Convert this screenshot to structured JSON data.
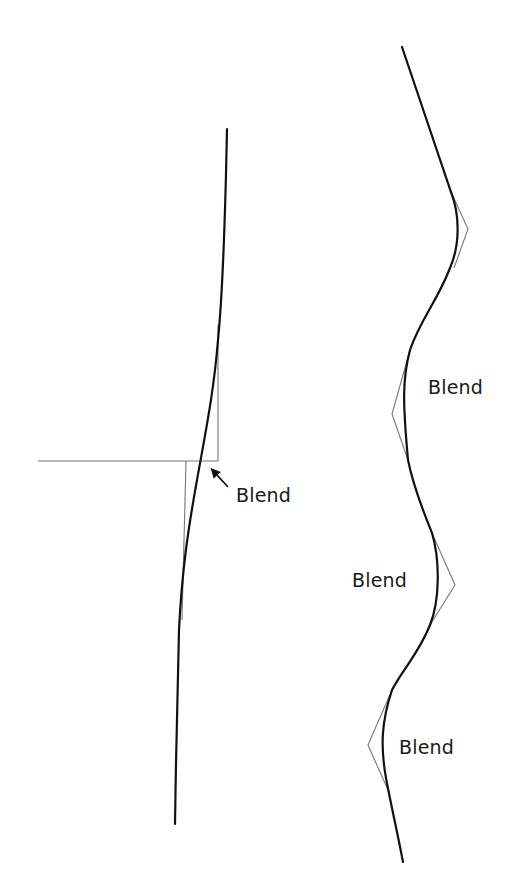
{
  "figure": {
    "colors": {
      "background": "#ffffff",
      "curve": "#111111",
      "construction": "#777777",
      "text": "#1a1a1a"
    }
  },
  "left_diagram": {
    "labels": [
      {
        "text": "Blend",
        "x": 236,
        "y": 486
      }
    ],
    "arrow": {
      "from": [
        228,
        487
      ],
      "to": [
        212,
        470
      ]
    },
    "curve_path": "M227,129 C225,230 222,300 218,340 C214,390 206,430 197,480 C188,530 182,570 179,630 C177,700 176,760 175,824",
    "construction_lines": [
      {
        "x1": 218,
        "y1": 325,
        "x2": 218,
        "y2": 461
      },
      {
        "x1": 38,
        "y1": 461,
        "x2": 218,
        "y2": 461
      },
      {
        "x1": 186,
        "y1": 461,
        "x2": 182,
        "y2": 620
      }
    ]
  },
  "right_diagram": {
    "labels": [
      {
        "text": "Blend",
        "x": 428,
        "y": 378
      },
      {
        "text": "Blend",
        "x": 352,
        "y": 571
      },
      {
        "text": "Blend",
        "x": 399,
        "y": 738
      }
    ],
    "curve_path": "M402,47 L451,192 C460,215 460,245 450,268 C438,300 420,320 410,350 C402,380 403,405 408,460 C414,490 425,515 432,533 C440,560 440,600 430,625 C418,655 402,670 392,690 C382,720 380,745 386,778 C392,810 398,835 403,862",
    "control_polygons": [
      {
        "points": "451,192 468,229 454,268"
      },
      {
        "points": "410,350 392,414 408,460"
      },
      {
        "points": "432,533 455,585 430,625"
      },
      {
        "points": "392,690 368,745 388,790"
      }
    ]
  }
}
